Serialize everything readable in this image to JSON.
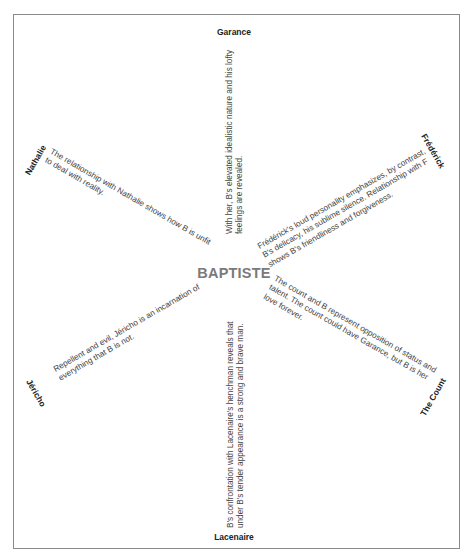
{
  "center": {
    "label": "BAPTISTE",
    "color": "#7a7a7a"
  },
  "relationships": [
    {
      "character": "Garance",
      "position": "top",
      "description": "With her, B's elevated idealistic nature and his lofty feelings are revealed."
    },
    {
      "character": "Frédérick",
      "position": "upper-right",
      "description": "Frédérick's loud personality emphasizes, by contrast, B's delicacy, his sublime silence. Relationship with F shows B's friendliness and forgiveness."
    },
    {
      "character": "The Count",
      "position": "lower-right",
      "description": "The count and B represent opposition of status and talent. The count could have Garance, but B is her love forever."
    },
    {
      "character": "Lacenaire",
      "position": "bottom",
      "description": "B's confrontation with Lacenaire's henchman reveals that under B's tender appearance is a strong and brave man."
    },
    {
      "character": "Jéricho",
      "position": "lower-left",
      "description": "Repellent and evil, Jéricho is an incarnation of everything that B is not."
    },
    {
      "character": "Nathalie",
      "position": "upper-left",
      "description": "The relationship with Nathalie shows how B is unfit to deal with reality."
    }
  ]
}
